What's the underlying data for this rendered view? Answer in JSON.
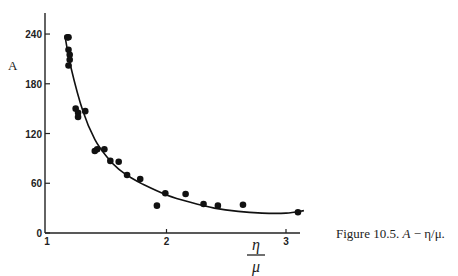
{
  "chart_data": {
    "type": "scatter",
    "title": "",
    "xlabel": "η/μ",
    "ylabel": "A",
    "xlim": [
      1,
      3.15
    ],
    "ylim": [
      0,
      265
    ],
    "x_ticks": [
      1,
      2,
      3
    ],
    "x_tick_labels": [
      "1",
      "2",
      "3"
    ],
    "y_ticks": [
      0,
      60,
      120,
      180,
      240
    ],
    "y_tick_labels": [
      "0",
      "60",
      "120",
      "180",
      "240"
    ],
    "grid": false,
    "legend": null,
    "series": [
      {
        "name": "measured",
        "kind": "points",
        "x": [
          1.17,
          1.18,
          1.18,
          1.19,
          1.19,
          1.18,
          1.24,
          1.26,
          1.32,
          1.26,
          1.4,
          1.42,
          1.48,
          1.53,
          1.6,
          1.67,
          1.78,
          1.92,
          1.99,
          2.16,
          2.31,
          2.43,
          2.64,
          3.1
        ],
        "y": [
          236,
          236,
          221,
          215,
          209,
          202,
          150,
          145,
          147,
          140,
          99,
          101,
          101,
          87,
          86,
          70,
          65,
          33,
          48,
          47,
          35,
          33,
          34,
          25
        ]
      },
      {
        "name": "fitted curve",
        "kind": "line",
        "x": [
          1.15,
          1.2,
          1.3,
          1.4,
          1.5,
          1.6,
          1.7,
          1.8,
          2.0,
          2.2,
          2.4,
          2.6,
          2.8,
          3.0,
          3.15
        ],
        "y": [
          238,
          200,
          147,
          113,
          92,
          77,
          67,
          59,
          46,
          37,
          30,
          26,
          24,
          24,
          27
        ]
      }
    ],
    "caption": "Figure 10.5. A − η/μ."
  },
  "axes": {
    "y_label": "A",
    "x_label_numerator": "η",
    "x_label_denominator": "μ"
  },
  "caption": {
    "prefix": "Figure 10.5. ",
    "symbol": "A",
    "suffix": " − η/μ."
  }
}
